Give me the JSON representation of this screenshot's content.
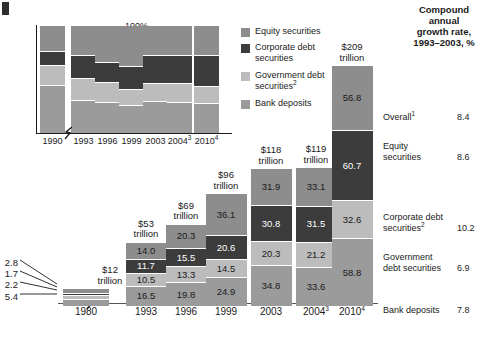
{
  "corner_mark": "",
  "legend": {
    "items": [
      {
        "label": "Equity securities",
        "color": "#8d8d8d",
        "key": "equity"
      },
      {
        "label": "Corporate debt securities",
        "color": "#3c3c3c",
        "key": "corporate"
      },
      {
        "label": "Government debt securities²",
        "color": "#bcbcbc",
        "key": "government"
      },
      {
        "label": "Bank deposits",
        "color": "#9b9b9b",
        "key": "deposits"
      }
    ]
  },
  "right_panel": {
    "heading": "Compound annual growth rate, 1993–2003, %",
    "heading_lines": [
      "Compound",
      "annual",
      "growth rate,",
      "1993–2003, %"
    ],
    "rows": [
      {
        "name": "Overall¹",
        "value": "8.4"
      },
      {
        "name": "Equity securities",
        "name_lines": [
          "Equity",
          "securities"
        ],
        "value": "8.6"
      },
      {
        "name": "Corporate debt securities²",
        "name_lines": [
          "Corporate debt",
          "securities²"
        ],
        "value": "10.2"
      },
      {
        "name": "Government debt securities",
        "name_lines": [
          "Government",
          "debt securities"
        ],
        "value": "6.9"
      },
      {
        "name": "Bank deposits",
        "name_lines": [
          "Bank deposits"
        ],
        "value": "7.8"
      }
    ]
  },
  "top_chart": {
    "y_ticks": [
      "100%",
      "80%",
      "60%",
      "40%",
      "20%",
      "0%"
    ],
    "x_labels": [
      "1990",
      "1993",
      "1996",
      "1999",
      "2003",
      "2004³",
      "2010⁴"
    ]
  },
  "bottom_chart": {
    "x_labels": [
      "1980",
      "1993",
      "1996",
      "1999",
      "2003",
      "2004³",
      "2010⁴"
    ],
    "totals": [
      "$12 trillion",
      "$53 trillion",
      "$69 trillion",
      "$96 trillion",
      "$118 trillion",
      "$119 trillion",
      "$209 trillion"
    ],
    "callout_labels_1980": [
      "2.8",
      "1.7",
      "2.2",
      "5.4"
    ]
  },
  "chart_data": [
    {
      "type": "bar",
      "id": "share-of-total-financial-assets",
      "title": "",
      "xlabel": "",
      "ylabel": "",
      "ylim": [
        0,
        100
      ],
      "grid": false,
      "stacked": true,
      "percent": true,
      "legend_position": "right",
      "categories": [
        "1990",
        "1993",
        "1996",
        "1999",
        "2003",
        "2004³",
        "2010⁴"
      ],
      "series": [
        {
          "name": "Bank deposits",
          "color": "#9b9b9b",
          "values": [
            45,
            31,
            29,
            26,
            30,
            29,
            28
          ]
        },
        {
          "name": "Government debt securities²",
          "color": "#bcbcbc",
          "values": [
            19,
            20,
            19,
            15,
            17,
            18,
            16
          ]
        },
        {
          "name": "Corporate debt securities",
          "color": "#3c3c3c",
          "values": [
            13,
            22,
            18,
            22,
            26,
            26,
            29
          ]
        },
        {
          "name": "Equity securities",
          "color": "#8d8d8d",
          "values": [
            23,
            27,
            34,
            37,
            27,
            27,
            27
          ]
        }
      ]
    },
    {
      "type": "bar",
      "id": "global-financial-stock-trillions",
      "title": "",
      "xlabel": "",
      "ylabel": "$ trillion",
      "ylim": [
        0,
        209
      ],
      "grid": false,
      "stacked": true,
      "legend_position": "shared-with-top-chart",
      "categories": [
        "1980",
        "1993",
        "1996",
        "1999",
        "2003",
        "2004³",
        "2010⁴"
      ],
      "totals": [
        12,
        53,
        69,
        96,
        118,
        119,
        209
      ],
      "series": [
        {
          "name": "Bank deposits",
          "color": "#9b9b9b",
          "values": [
            5.4,
            16.5,
            19.8,
            24.9,
            34.8,
            33.6,
            58.8
          ]
        },
        {
          "name": "Government debt securities²",
          "color": "#bcbcbc",
          "values": [
            2.2,
            10.5,
            13.3,
            14.5,
            20.3,
            21.2,
            32.6
          ]
        },
        {
          "name": "Corporate debt securities",
          "color": "#3c3c3c",
          "values": [
            1.7,
            11.7,
            15.5,
            20.6,
            30.8,
            31.5,
            60.7
          ]
        },
        {
          "name": "Equity securities",
          "color": "#8d8d8d",
          "values": [
            2.8,
            14.0,
            20.3,
            36.1,
            31.9,
            33.1,
            56.8
          ]
        }
      ]
    }
  ]
}
